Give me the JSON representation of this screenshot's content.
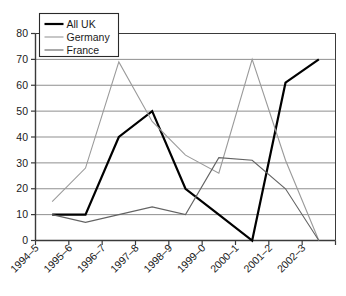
{
  "chart_data": {
    "type": "line",
    "title": "",
    "xlabel": "",
    "ylabel": "",
    "ylim": [
      0,
      80
    ],
    "ytick_step": 10,
    "grid": true,
    "legend_position": "top-left",
    "categories": [
      "1994–5",
      "1995–6",
      "1996–7",
      "1997–8",
      "1998–9",
      "1999–0",
      "2000–1",
      "2001–2",
      "2002–3"
    ],
    "yticks": [
      "0",
      "10",
      "20",
      "30",
      "40",
      "50",
      "60",
      "70",
      "80"
    ],
    "series": [
      {
        "name": "All UK",
        "color": "#000000",
        "width": 2.2,
        "values": [
          10,
          10,
          40,
          50,
          20,
          10,
          0,
          61,
          70
        ]
      },
      {
        "name": "Germany",
        "color": "#9a9a9a",
        "width": 1.1,
        "values": [
          15,
          28,
          69,
          46,
          33,
          26,
          70,
          31,
          0
        ]
      },
      {
        "name": "France",
        "color": "#636363",
        "width": 1.1,
        "values": [
          10,
          7,
          10,
          13,
          10,
          32,
          31,
          20,
          0
        ]
      }
    ]
  },
  "legend": {
    "entries": [
      {
        "label": "All UK"
      },
      {
        "label": "Germany"
      },
      {
        "label": "France"
      }
    ]
  },
  "axes": {
    "y_tick_labels": [
      "80",
      "70",
      "60",
      "50",
      "40",
      "30",
      "20",
      "10",
      "0"
    ],
    "x_tick_labels": [
      "1994–5",
      "1995–6",
      "1996–7",
      "1997–8",
      "1998–9",
      "1999–0",
      "2000–1",
      "2001–2",
      "2002–3"
    ]
  },
  "style": {
    "axis_color": "#3a3a3a",
    "grid_color": "#8f8f8f",
    "background": "#ffffff"
  }
}
